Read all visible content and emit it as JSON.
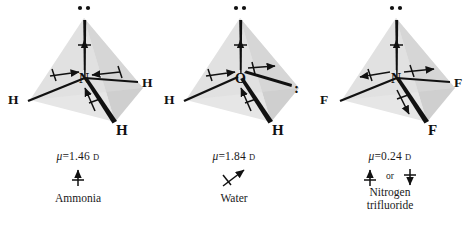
{
  "figure": {
    "type": "molecular-dipole-diagram",
    "background": "#ffffff",
    "ink": "#111111",
    "tetrahedron_face_light": "#e4e4e4",
    "tetrahedron_face_dark": "#cfcfcf"
  },
  "molecules": [
    {
      "id": "ammonia",
      "name": "Ammonia",
      "name_lines": [
        "Ammonia"
      ],
      "center_atom": "N",
      "outer_atoms": [
        "H",
        "H",
        "H"
      ],
      "lone_pair_top": "••",
      "lone_pair_side": "",
      "mu_symbol": "μ",
      "mu_equals": "=",
      "mu_value": "1.46",
      "mu_unit": "D",
      "mu_text": "μ = 1.46 D",
      "bond_dipole_direction": "toward-center",
      "net_dipole": "up",
      "net_dipole_alternatives": ""
    },
    {
      "id": "water",
      "name": "Water",
      "name_lines": [
        "Water"
      ],
      "center_atom": "O",
      "outer_atoms": [
        "H",
        "H"
      ],
      "lone_pair_top": "••",
      "lone_pair_side": ":",
      "mu_symbol": "μ",
      "mu_equals": "=",
      "mu_value": "1.84",
      "mu_unit": "D",
      "mu_text": "μ = 1.84 D",
      "bond_dipole_direction": "toward-center",
      "net_dipole": "up-right-diagonal",
      "net_dipole_alternatives": ""
    },
    {
      "id": "nitrogen-trifluoride",
      "name": "Nitrogen trifluoride",
      "name_lines": [
        "Nitrogen",
        "trifluoride"
      ],
      "center_atom": "N",
      "outer_atoms": [
        "F",
        "F",
        "F"
      ],
      "lone_pair_top": "••",
      "lone_pair_side": "",
      "mu_symbol": "μ",
      "mu_equals": "=",
      "mu_value": "0.24",
      "mu_unit": "D",
      "mu_text": "μ = 0.24 D",
      "bond_dipole_direction": "away-from-center",
      "net_dipole": "up-or-down",
      "net_dipole_alternatives": "or"
    }
  ]
}
